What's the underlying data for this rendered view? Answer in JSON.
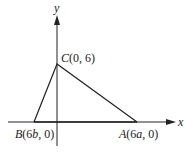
{
  "diagram": {
    "axes": {
      "x_label": "x",
      "y_label": "y"
    },
    "points": {
      "A": {
        "name": "A",
        "coords": "(6a, 0)",
        "coord_open": "(6",
        "coord_var": "a",
        "coord_close": ", 0)"
      },
      "B": {
        "name": "B",
        "coords": "(6b, 0)",
        "coord_open": "(6",
        "coord_var": "b",
        "coord_close": ", 0)"
      },
      "C": {
        "name": "C",
        "coords": "(0, 6)",
        "coord_text": "(0, 6)"
      }
    },
    "shape": "triangle ABC",
    "colors": {
      "stroke": "#222222",
      "background": "#ffffff"
    }
  }
}
